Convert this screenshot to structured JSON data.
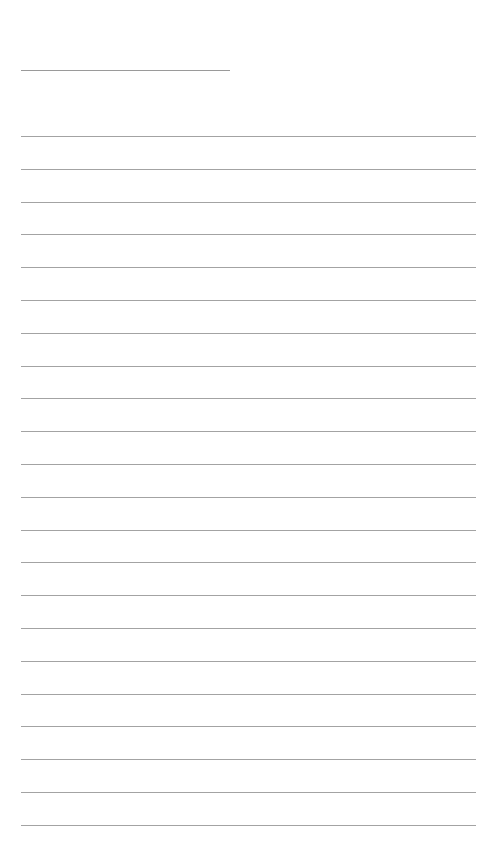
{
  "page": {
    "type": "lined-paper",
    "background_color": "#ffffff",
    "line_color": "#a3a3a3",
    "title_line": {
      "present": true,
      "text": ""
    },
    "ruled_lines": {
      "count": 22,
      "first_y": 136,
      "spacing": 32.8,
      "texts": [
        "",
        "",
        "",
        "",
        "",
        "",
        "",
        "",
        "",
        "",
        "",
        "",
        "",
        "",
        "",
        "",
        "",
        "",
        "",
        "",
        "",
        ""
      ]
    }
  }
}
